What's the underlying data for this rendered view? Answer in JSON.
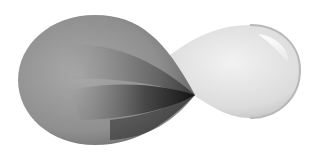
{
  "graphic": {
    "description": "infinity ribbon logo",
    "colors": {
      "left_lobe_light": "#a8a8a8",
      "left_lobe_mid": "#7a7a7a",
      "left_lobe_dark": "#111111",
      "right_lobe_light": "#f4f4f4",
      "right_lobe_mid": "#d6d6d6",
      "right_lobe_edge": "#b4b4b4",
      "background": "#ffffff"
    }
  }
}
